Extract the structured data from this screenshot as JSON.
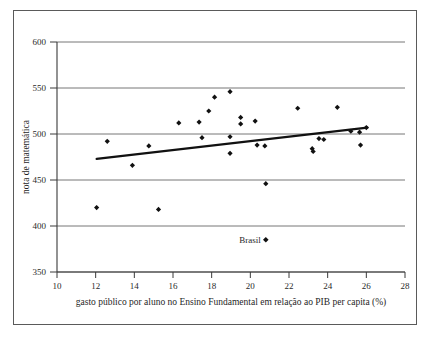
{
  "chart_data": {
    "type": "scatter",
    "title": "",
    "xlabel": "gasto público por aluno no Ensino Fundamental em relação ao PIB per capita (%)",
    "ylabel": "nota de matemática",
    "xlim": [
      10,
      28
    ],
    "ylim": [
      350,
      600
    ],
    "xticks": [
      10,
      12,
      14,
      16,
      18,
      20,
      22,
      24,
      26,
      28
    ],
    "xtick_labels": [
      "10",
      "12",
      "14",
      "16",
      "18",
      "20",
      "22",
      "24",
      "26",
      "28"
    ],
    "yticks": [
      350,
      400,
      450,
      500,
      550,
      600
    ],
    "ytick_labels": [
      "350",
      "400",
      "450",
      "500",
      "550",
      "600"
    ],
    "grid": "horizontal",
    "legend": "none",
    "marker": "diamond",
    "marker_color": "#111111",
    "points": [
      {
        "x": 12.05,
        "y": 420
      },
      {
        "x": 12.6,
        "y": 492
      },
      {
        "x": 13.9,
        "y": 466
      },
      {
        "x": 14.75,
        "y": 487
      },
      {
        "x": 15.25,
        "y": 418
      },
      {
        "x": 16.3,
        "y": 512
      },
      {
        "x": 17.35,
        "y": 513
      },
      {
        "x": 17.5,
        "y": 496
      },
      {
        "x": 17.85,
        "y": 525
      },
      {
        "x": 18.15,
        "y": 540
      },
      {
        "x": 18.95,
        "y": 546
      },
      {
        "x": 18.95,
        "y": 497
      },
      {
        "x": 18.95,
        "y": 479
      },
      {
        "x": 19.5,
        "y": 518
      },
      {
        "x": 19.5,
        "y": 511
      },
      {
        "x": 20.25,
        "y": 514
      },
      {
        "x": 20.35,
        "y": 488
      },
      {
        "x": 20.75,
        "y": 487
      },
      {
        "x": 20.8,
        "y": 446
      },
      {
        "x": 22.45,
        "y": 528
      },
      {
        "x": 23.2,
        "y": 484
      },
      {
        "x": 23.25,
        "y": 481
      },
      {
        "x": 23.55,
        "y": 495
      },
      {
        "x": 23.8,
        "y": 494
      },
      {
        "x": 24.5,
        "y": 529
      },
      {
        "x": 25.2,
        "y": 503
      },
      {
        "x": 25.65,
        "y": 502
      },
      {
        "x": 25.7,
        "y": 488
      },
      {
        "x": 26.0,
        "y": 507
      }
    ],
    "annotations": [
      {
        "label": "Brasil",
        "x": 20.8,
        "y": 385
      }
    ],
    "trendline": {
      "x_start": 12.05,
      "y_start": 473,
      "x_end": 26.05,
      "y_end": 507
    }
  },
  "axes": {
    "y_axis_title": "nota de matemática",
    "x_axis_title": "gasto público por aluno no Ensino Fundamental em relação ao PIB per capita (%)"
  }
}
